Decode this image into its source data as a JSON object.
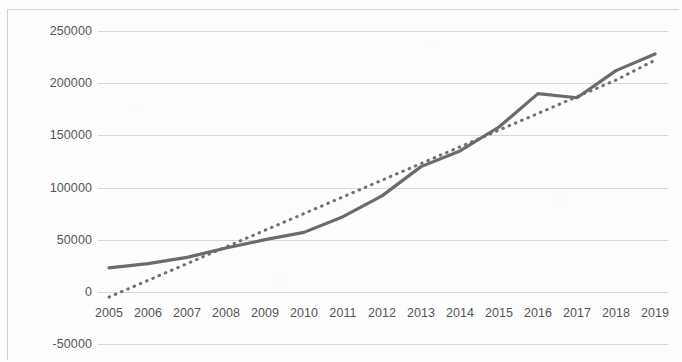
{
  "chart_data": {
    "type": "line",
    "title": "",
    "subtitle": "",
    "xlabel": "",
    "ylabel": "",
    "categories": [
      "2005",
      "2006",
      "2007",
      "2008",
      "2009",
      "2010",
      "2011",
      "2012",
      "2013",
      "2014",
      "2015",
      "2016",
      "2017",
      "2018",
      "2019"
    ],
    "x": [
      2005,
      2006,
      2007,
      2008,
      2009,
      2010,
      2011,
      2012,
      2013,
      2014,
      2015,
      2016,
      2017,
      2018,
      2019
    ],
    "series": [
      {
        "name": "data",
        "style": "solid",
        "color": "#6b6b6b",
        "values": [
          23000,
          27000,
          33000,
          42000,
          50000,
          57000,
          72000,
          92000,
          120000,
          135000,
          158000,
          190000,
          186000,
          212000,
          228000
        ]
      },
      {
        "name": "trendline",
        "style": "dotted",
        "color": "#6f6f6f",
        "values": [
          -5000,
          11000,
          27000,
          43000,
          59000,
          75000,
          91000,
          107000,
          123000,
          139000,
          155000,
          171000,
          187000,
          203000,
          222000
        ]
      }
    ],
    "ylim": [
      -50000,
      250000
    ],
    "yticks": [
      250000,
      200000,
      150000,
      100000,
      50000,
      0,
      -50000
    ],
    "ytick_labels": [
      "250000",
      "200000",
      "150000",
      "100000",
      "50000",
      "0",
      "-50000"
    ],
    "xticks": [
      2005,
      2006,
      2007,
      2008,
      2009,
      2010,
      2011,
      2012,
      2013,
      2014,
      2015,
      2016,
      2017,
      2018,
      2019
    ],
    "xtick_labels": [
      "2005",
      "2006",
      "2007",
      "2008",
      "2009",
      "2010",
      "2011",
      "2012",
      "2013",
      "2014",
      "2015",
      "2016",
      "2017",
      "2018",
      "2019"
    ],
    "grid": true,
    "grid_axis": "y",
    "legend": false,
    "legend_position": "none",
    "annotations": [],
    "gridline_color": "#d8d8d8",
    "axis_label_color": "#555456",
    "background_color": "#fdfdfd"
  }
}
